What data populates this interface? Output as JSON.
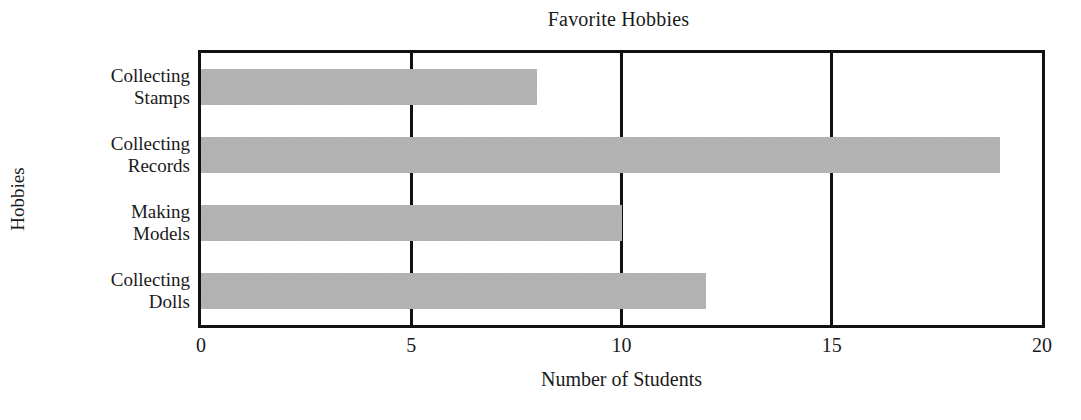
{
  "chart_data": {
    "type": "bar",
    "orientation": "horizontal",
    "title": "Favorite Hobbies",
    "xlabel": "Number of Students",
    "ylabel": "Hobbies",
    "categories": [
      "Collecting Stamps",
      "Collecting Records",
      "Making Models",
      "Collecting Dolls"
    ],
    "category_lines": [
      [
        "Collecting",
        "Stamps"
      ],
      [
        "Collecting",
        "Records"
      ],
      [
        "Making",
        "Models"
      ],
      [
        "Collecting",
        "Dolls"
      ]
    ],
    "values": [
      8,
      19,
      10,
      12
    ],
    "xlim": [
      0,
      20
    ],
    "xticks": [
      0,
      5,
      10,
      15,
      20
    ],
    "xtick_labels": [
      "0",
      "5",
      "10",
      "15",
      "20"
    ],
    "grid": true,
    "grid_axis": "x",
    "legend": false,
    "bar_color": "#a9a9a9",
    "frame_color": "#111111",
    "background_color": "#ffffff"
  }
}
